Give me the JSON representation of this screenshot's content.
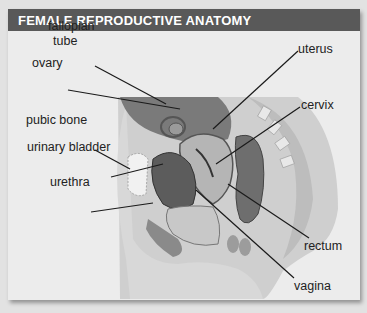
{
  "header": {
    "title": "FEMALE REPRODUCTIVE ANATOMY"
  },
  "labels": {
    "fallopian_tube_line1": "fallopian",
    "fallopian_tube_line2": "tube",
    "ovary": "ovary",
    "pubic_bone": "pubic bone",
    "urinary_bladder": "urinary bladder",
    "urethra": "urethra",
    "uterus": "uterus",
    "cervix": "cervix",
    "rectum": "rectum",
    "vagina": "vagina"
  },
  "colors": {
    "header_bg": "#595959",
    "panel_bg": "#ececec",
    "label_text": "#222222",
    "leader_line": "#1a1a1a"
  }
}
